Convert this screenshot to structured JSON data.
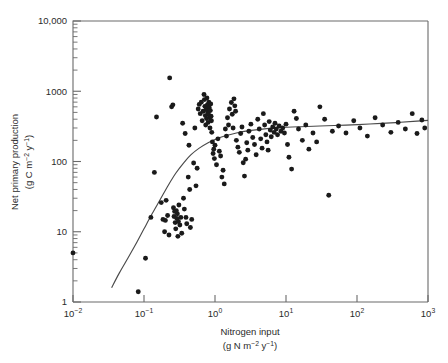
{
  "figure": {
    "background_color": "#ffffff",
    "frame_color": "#6a6a6a",
    "point_color": "#1a1a1a",
    "curve_color": "#4a4a4a"
  },
  "axes": {
    "x": {
      "title_line1": "Nitrogen input",
      "title_line2_prefix": "(g N m",
      "title_line2_sup1": "−2",
      "title_line2_mid": " y",
      "title_line2_sup2": "−1",
      "title_line2_suffix": ")",
      "ticks": [
        {
          "label_base": "10",
          "label_sup": "−2",
          "value": 0.01
        },
        {
          "label_base": "10",
          "label_sup": "−1",
          "value": 0.1
        },
        {
          "label_base": "10",
          "label_sup": "0",
          "value": 1
        },
        {
          "label_base": "10",
          "label_sup": "1",
          "value": 10
        },
        {
          "label_base": "10",
          "label_sup": "2",
          "value": 100
        },
        {
          "label_base": "10",
          "label_sup": "3",
          "value": 1000
        }
      ]
    },
    "y": {
      "title_line1": "Net primary production",
      "title_line2_prefix": "(g C m",
      "title_line2_sup1": "−2",
      "title_line2_mid": " y",
      "title_line2_sup2": "−1",
      "title_line2_suffix": ")",
      "ticks": [
        {
          "label": "10,000",
          "value": 10000
        },
        {
          "label": "1000",
          "value": 1000
        },
        {
          "label": "100",
          "value": 100
        },
        {
          "label": "10",
          "value": 10
        },
        {
          "label": "1",
          "value": 1
        }
      ]
    }
  },
  "chart_data": {
    "type": "scatter",
    "title": "",
    "xlabel": "Nitrogen input (g N m-2 y-1)",
    "ylabel": "Net primary production (g C m-2 y-1)",
    "xscale": "log",
    "yscale": "log",
    "xlim": [
      0.01,
      1000
    ],
    "ylim": [
      1,
      10000
    ],
    "grid": false,
    "legend": "none",
    "marker": "filled-circle",
    "series": [
      {
        "name": "Observations",
        "points": [
          [
            0.01,
            5.0
          ],
          [
            0.083,
            1.4
          ],
          [
            0.105,
            4.2
          ],
          [
            0.125,
            16.0
          ],
          [
            0.14,
            70.0
          ],
          [
            0.15,
            430.0
          ],
          [
            0.175,
            26.0
          ],
          [
            0.185,
            15.0
          ],
          [
            0.195,
            10.0
          ],
          [
            0.2,
            14.5
          ],
          [
            0.205,
            28.0
          ],
          [
            0.215,
            17.0
          ],
          [
            0.225,
            9.0
          ],
          [
            0.23,
            1550.0
          ],
          [
            0.245,
            600.0
          ],
          [
            0.255,
            640.0
          ],
          [
            0.26,
            22.0
          ],
          [
            0.265,
            16.5
          ],
          [
            0.27,
            19.5
          ],
          [
            0.275,
            13.5
          ],
          [
            0.28,
            11.0
          ],
          [
            0.285,
            20.0
          ],
          [
            0.29,
            15.5
          ],
          [
            0.295,
            18.0
          ],
          [
            0.3,
            8.6
          ],
          [
            0.305,
            14.0
          ],
          [
            0.31,
            24.0
          ],
          [
            0.32,
            12.5
          ],
          [
            0.33,
            16.0
          ],
          [
            0.34,
            9.5
          ],
          [
            0.35,
            350.0
          ],
          [
            0.36,
            30.0
          ],
          [
            0.37,
            21.0
          ],
          [
            0.38,
            250.0
          ],
          [
            0.39,
            16.0
          ],
          [
            0.4,
            13.0
          ],
          [
            0.42,
            60.0
          ],
          [
            0.43,
            170.0
          ],
          [
            0.44,
            40.0
          ],
          [
            0.45,
            11.5
          ],
          [
            0.47,
            15.0
          ],
          [
            0.5,
            95.0
          ],
          [
            0.52,
            300.0
          ],
          [
            0.54,
            45.0
          ],
          [
            0.56,
            80.0
          ],
          [
            0.58,
            560.0
          ],
          [
            0.6,
            650.0
          ],
          [
            0.62,
            480.0
          ],
          [
            0.64,
            700.0
          ],
          [
            0.66,
            380.0
          ],
          [
            0.68,
            520.0
          ],
          [
            0.7,
            900.0
          ],
          [
            0.71,
            760.0
          ],
          [
            0.72,
            610.0
          ],
          [
            0.73,
            450.0
          ],
          [
            0.74,
            330.0
          ],
          [
            0.75,
            550.0
          ],
          [
            0.76,
            410.0
          ],
          [
            0.77,
            800.0
          ],
          [
            0.78,
            640.0
          ],
          [
            0.79,
            500.0
          ],
          [
            0.8,
            360.0
          ],
          [
            0.81,
            470.0
          ],
          [
            0.82,
            700.0
          ],
          [
            0.83,
            580.0
          ],
          [
            0.84,
            420.0
          ],
          [
            0.85,
            300.0
          ],
          [
            0.86,
            530.0
          ],
          [
            0.87,
            660.0
          ],
          [
            0.88,
            440.0
          ],
          [
            0.89,
            380.0
          ],
          [
            0.9,
            260.0
          ],
          [
            0.92,
            190.0
          ],
          [
            0.94,
            130.0
          ],
          [
            0.96,
            150.0
          ],
          [
            0.98,
            110.0
          ],
          [
            1.0,
            170.0
          ],
          [
            1.05,
            90.0
          ],
          [
            1.1,
            210.0
          ],
          [
            1.15,
            140.0
          ],
          [
            1.2,
            120.0
          ],
          [
            1.25,
            60.0
          ],
          [
            1.3,
            75.0
          ],
          [
            1.35,
            48.0
          ],
          [
            1.4,
            290.0
          ],
          [
            1.45,
            230.0
          ],
          [
            1.5,
            420.0
          ],
          [
            1.55,
            330.0
          ],
          [
            1.6,
            560.0
          ],
          [
            1.7,
            690.0
          ],
          [
            1.75,
            470.0
          ],
          [
            1.8,
            300.0
          ],
          [
            1.85,
            780.0
          ],
          [
            1.9,
            620.0
          ],
          [
            1.95,
            520.0
          ],
          [
            2.0,
            200.0
          ],
          [
            2.1,
            160.0
          ],
          [
            2.2,
            135.0
          ],
          [
            2.3,
            250.0
          ],
          [
            2.4,
            310.0
          ],
          [
            2.5,
            96.0
          ],
          [
            2.6,
            62.0
          ],
          [
            2.7,
            108.0
          ],
          [
            2.8,
            185.0
          ],
          [
            2.9,
            145.0
          ],
          [
            3.0,
            270.0
          ],
          [
            3.2,
            340.0
          ],
          [
            3.4,
            220.0
          ],
          [
            3.6,
            175.0
          ],
          [
            3.8,
            125.0
          ],
          [
            4.0,
            400.0
          ],
          [
            4.2,
            290.0
          ],
          [
            4.4,
            210.0
          ],
          [
            4.6,
            155.0
          ],
          [
            4.8,
            480.0
          ],
          [
            5.0,
            330.0
          ],
          [
            5.2,
            240.0
          ],
          [
            5.4,
            190.0
          ],
          [
            5.6,
            145.0
          ],
          [
            5.8,
            370.0
          ],
          [
            6.0,
            280.0
          ],
          [
            6.2,
            225.0
          ],
          [
            6.5,
            310.0
          ],
          [
            6.8,
            260.0
          ],
          [
            7.0,
            350.0
          ],
          [
            7.3,
            290.0
          ],
          [
            7.6,
            240.0
          ],
          [
            8.0,
            320.0
          ],
          [
            8.5,
            270.0
          ],
          [
            9.0,
            300.0
          ],
          [
            9.5,
            255.0
          ],
          [
            10.0,
            340.0
          ],
          [
            10.5,
            175.0
          ],
          [
            11.0,
            115.0
          ],
          [
            12.0,
            78.0
          ],
          [
            13.0,
            520.0
          ],
          [
            14.0,
            410.0
          ],
          [
            15.0,
            290.0
          ],
          [
            17.0,
            200.0
          ],
          [
            19.0,
            330.0
          ],
          [
            21.0,
            150.0
          ],
          [
            24.0,
            255.0
          ],
          [
            27.0,
            190.0
          ],
          [
            30.0,
            600.0
          ],
          [
            35.0,
            400.0
          ],
          [
            40.0,
            33.0
          ],
          [
            45.0,
            270.0
          ],
          [
            55.0,
            320.0
          ],
          [
            70.0,
            255.0
          ],
          [
            90.0,
            380.0
          ],
          [
            110.0,
            300.0
          ],
          [
            140.0,
            230.0
          ],
          [
            180.0,
            420.0
          ],
          [
            230.0,
            330.0
          ],
          [
            300.0,
            260.0
          ],
          [
            380.0,
            360.0
          ],
          [
            480.0,
            290.0
          ],
          [
            600.0,
            480.0
          ],
          [
            700.0,
            250.0
          ],
          [
            820.0,
            390.0
          ],
          [
            900.0,
            300.0
          ]
        ]
      }
    ],
    "fit_curve": {
      "name": "Fitted saturating response",
      "points": [
        [
          0.035,
          1.6
        ],
        [
          0.045,
          2.6
        ],
        [
          0.06,
          4.3
        ],
        [
          0.08,
          7.2
        ],
        [
          0.1,
          11.0
        ],
        [
          0.13,
          18.0
        ],
        [
          0.17,
          29.0
        ],
        [
          0.22,
          46.0
        ],
        [
          0.28,
          68.0
        ],
        [
          0.36,
          95.0
        ],
        [
          0.46,
          125.0
        ],
        [
          0.6,
          155.0
        ],
        [
          0.8,
          185.0
        ],
        [
          1.0,
          205.0
        ],
        [
          1.4,
          232.0
        ],
        [
          2.0,
          255.0
        ],
        [
          3.0,
          275.0
        ],
        [
          5.0,
          292.0
        ],
        [
          8.0,
          303.0
        ],
        [
          15.0,
          312.0
        ],
        [
          30.0,
          320.0
        ],
        [
          70.0,
          330.0
        ],
        [
          150.0,
          342.0
        ],
        [
          350.0,
          358.0
        ],
        [
          700.0,
          375.0
        ],
        [
          1000.0,
          385.0
        ]
      ]
    }
  }
}
